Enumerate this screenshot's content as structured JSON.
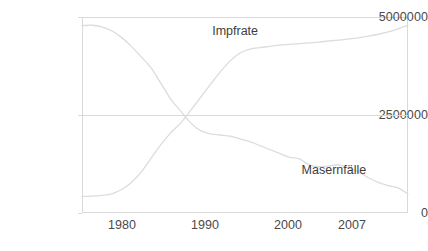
{
  "chart_data": {
    "type": "line",
    "title": "",
    "subtitle": "",
    "xlabel": "",
    "ylabel": "",
    "grid": "horizontal-midline-only",
    "legend_position": "inline-annotations",
    "xlim": [
      1975,
      2008
    ],
    "ylim": [
      0,
      5000000
    ],
    "y_ticks": [
      0,
      2500000,
      5000000
    ],
    "y_tick_labels": [
      "0",
      "2500000",
      "5000000"
    ],
    "x_ticks": [
      1980,
      1990,
      2000,
      2007
    ],
    "x_tick_labels": [
      "1980",
      "1990",
      "2000",
      "2007"
    ],
    "crossing_point": {
      "x": 1985.5,
      "y": 2500000
    },
    "series": [
      {
        "name": "Impfrate",
        "annotation_label": "Impfrate",
        "color": "#dcdcdc",
        "x": [
          1975,
          1976,
          1977,
          1978,
          1979,
          1980,
          1981,
          1982,
          1983,
          1984,
          1985,
          1986,
          1987,
          1988,
          1989,
          1990,
          1991,
          1992,
          1993,
          1994,
          1995,
          1996,
          1997,
          1998,
          1999,
          2000,
          2001,
          2002,
          2003,
          2004,
          2005,
          2006,
          2007,
          2008
        ],
        "values": [
          420000,
          430000,
          450000,
          490000,
          600000,
          780000,
          1050000,
          1400000,
          1750000,
          2050000,
          2300000,
          2620000,
          2950000,
          3280000,
          3600000,
          3880000,
          4080000,
          4180000,
          4220000,
          4250000,
          4280000,
          4300000,
          4320000,
          4340000,
          4360000,
          4390000,
          4410000,
          4440000,
          4470000,
          4510000,
          4560000,
          4620000,
          4700000,
          4790000
        ]
      },
      {
        "name": "Masernfälle",
        "annotation_label": "Masernfälle",
        "color": "#dcdcdc",
        "x": [
          1975,
          1976,
          1977,
          1978,
          1979,
          1980,
          1981,
          1982,
          1983,
          1984,
          1985,
          1986,
          1987,
          1988,
          1989,
          1990,
          1991,
          1992,
          1993,
          1994,
          1995,
          1996,
          1997,
          1998,
          1999,
          2000,
          2001,
          2002,
          2003,
          2004,
          2005,
          2006,
          2007,
          2008
        ],
        "values": [
          4780000,
          4790000,
          4750000,
          4650000,
          4480000,
          4250000,
          3980000,
          3700000,
          3300000,
          2900000,
          2600000,
          2300000,
          2100000,
          2020000,
          1990000,
          1960000,
          1890000,
          1820000,
          1720000,
          1620000,
          1520000,
          1420000,
          1380000,
          1230000,
          1180000,
          1200000,
          1230000,
          1150000,
          1050000,
          900000,
          780000,
          700000,
          640000,
          480000
        ]
      }
    ],
    "annotations": [
      {
        "text": "Impfrate",
        "x": 1990.5,
        "y": 4620000
      },
      {
        "text": "Masernfälle",
        "x": 2000.5,
        "y": 1070000
      }
    ]
  }
}
